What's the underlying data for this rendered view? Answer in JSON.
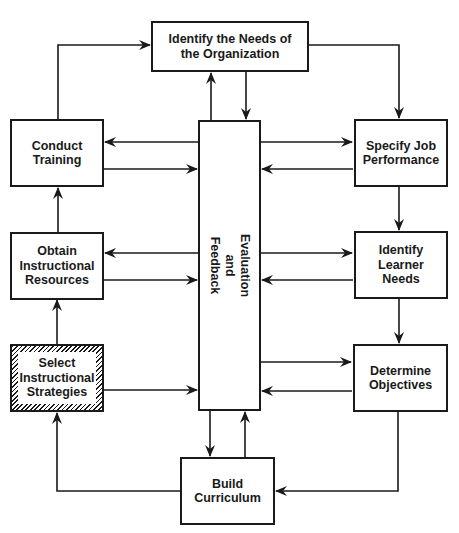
{
  "diagram": {
    "type": "flowchart",
    "nodes": {
      "needs_org": {
        "label": "Identify the Needs of\nthe Organization"
      },
      "conduct_training": {
        "label": "Conduct\nTraining"
      },
      "specify_job": {
        "label": "Specify Job\nPerformance"
      },
      "obtain_resources": {
        "label": "Obtain\nInstructional\nResources"
      },
      "learner_needs": {
        "label": "Identify\nLearner\nNeeds"
      },
      "select_strategies": {
        "label": "Select\nInstructional\nStrategies",
        "style": "hatched"
      },
      "determine_objectives": {
        "label": "Determine\nObjectives"
      },
      "build_curriculum": {
        "label": "Build\nCurriculum"
      },
      "evaluation": {
        "label": "Evaluation\nand\nFeedback"
      }
    },
    "edges": [
      {
        "from": "conduct_training",
        "to": "needs_org"
      },
      {
        "from": "needs_org",
        "to": "specify_job"
      },
      {
        "from": "specify_job",
        "to": "learner_needs"
      },
      {
        "from": "learner_needs",
        "to": "determine_objectives"
      },
      {
        "from": "determine_objectives",
        "to": "build_curriculum"
      },
      {
        "from": "build_curriculum",
        "to": "select_strategies"
      },
      {
        "from": "select_strategies",
        "to": "obtain_resources"
      },
      {
        "from": "obtain_resources",
        "to": "conduct_training"
      },
      {
        "from": "evaluation",
        "to": "needs_org"
      },
      {
        "from": "needs_org",
        "to": "evaluation"
      },
      {
        "from": "evaluation",
        "to": "conduct_training"
      },
      {
        "from": "conduct_training",
        "to": "evaluation"
      },
      {
        "from": "evaluation",
        "to": "specify_job"
      },
      {
        "from": "specify_job",
        "to": "evaluation"
      },
      {
        "from": "evaluation",
        "to": "obtain_resources"
      },
      {
        "from": "obtain_resources",
        "to": "evaluation"
      },
      {
        "from": "evaluation",
        "to": "learner_needs"
      },
      {
        "from": "learner_needs",
        "to": "evaluation"
      },
      {
        "from": "select_strategies",
        "to": "evaluation"
      },
      {
        "from": "evaluation",
        "to": "determine_objectives"
      },
      {
        "from": "determine_objectives",
        "to": "evaluation"
      },
      {
        "from": "evaluation",
        "to": "build_curriculum"
      },
      {
        "from": "build_curriculum",
        "to": "evaluation"
      }
    ],
    "colors": {
      "line": "#1a1a1a",
      "background": "#ffffff"
    }
  }
}
